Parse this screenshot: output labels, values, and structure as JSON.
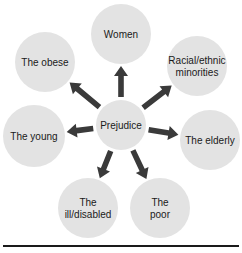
{
  "diagram": {
    "center": {
      "label": [
        "Prejudice"
      ],
      "cx": 121,
      "cy": 125,
      "r": 25
    },
    "nodes": [
      {
        "id": "women",
        "label": [
          "Women"
        ],
        "cx": 121,
        "cy": 34,
        "r": 30
      },
      {
        "id": "racial",
        "label": [
          "Racial/ethnic",
          "minorities"
        ],
        "cx": 197,
        "cy": 66,
        "r": 30
      },
      {
        "id": "elderly",
        "label": [
          "The elderly"
        ],
        "cx": 210,
        "cy": 140,
        "r": 30
      },
      {
        "id": "poor",
        "label": [
          "The",
          "poor"
        ],
        "cx": 160,
        "cy": 208,
        "r": 30
      },
      {
        "id": "ill",
        "label": [
          "The",
          "ill/disabled"
        ],
        "cx": 88,
        "cy": 208,
        "r": 30
      },
      {
        "id": "young",
        "label": [
          "The young"
        ],
        "cx": 34,
        "cy": 136,
        "r": 31
      },
      {
        "id": "obese",
        "label": [
          "The obese"
        ],
        "cx": 45,
        "cy": 62,
        "r": 30
      }
    ],
    "colors": {
      "circle": "#e3e3e3",
      "arrow": "#3a3a3a",
      "rule": "#1a1a1a"
    }
  }
}
